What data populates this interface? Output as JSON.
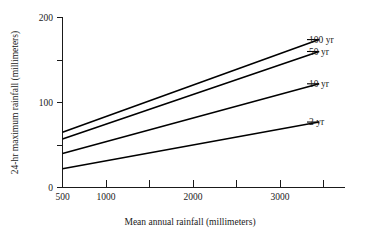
{
  "chart_data": {
    "type": "line",
    "title": "",
    "xlabel": "Mean annual rainfall (millimeters)",
    "ylabel": "24-hr maximum rainfall (millimeters)",
    "xlim": [
      500,
      3500
    ],
    "ylim": [
      0,
      200
    ],
    "grid": false,
    "legend_position": "right-inline-labels",
    "x_major_ticks": [
      500,
      1000,
      2000,
      3000
    ],
    "x_major_tick_labels": [
      "500",
      "1000",
      "2000",
      "3000"
    ],
    "x_all_ticks": [
      500,
      1000,
      1500,
      2000,
      2500,
      3000,
      3500
    ],
    "y_ticks": [
      0,
      50,
      100,
      150,
      200
    ],
    "y_tick_labels": [
      "0",
      "",
      "100",
      "",
      "200"
    ],
    "y_labeled_ticks": [
      0,
      100,
      200
    ],
    "x": [
      500,
      3450
    ],
    "series": [
      {
        "name": "100 yr",
        "label": "100 yr",
        "values": [
          65,
          174
        ]
      },
      {
        "name": "50 yr",
        "label": "50 yr",
        "values": [
          57,
          160
        ]
      },
      {
        "name": "10 yr",
        "label": "10 yr",
        "values": [
          40,
          122
        ]
      },
      {
        "name": "2 yr",
        "label": "2 yr",
        "values": [
          22,
          77
        ]
      }
    ]
  },
  "axes": {
    "y_title": "24-hr maximum rainfall (millimeters)",
    "x_title": "Mean annual rainfall (millimeters)",
    "y_labels": {
      "top": "200",
      "mid": "100",
      "bottom": "0"
    },
    "x_labels": {
      "t500": "500",
      "t1000": "1000",
      "t2000": "2000",
      "t3000": "3000"
    }
  },
  "series_labels": {
    "s100": "100 yr",
    "s50": "50 yr",
    "s10": "10 yr",
    "s2": "2 yr"
  },
  "colors": {
    "line": "#000000",
    "axis": "#1a1a1a",
    "background": "#ffffff"
  }
}
